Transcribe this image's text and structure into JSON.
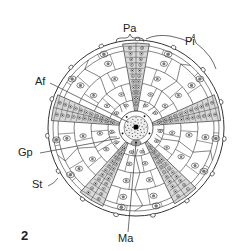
{
  "figure": {
    "number": "2",
    "colors": {
      "line": "#333333",
      "ambulacral_fill": "#d8d8d8",
      "background": "#ffffff"
    }
  },
  "labels": {
    "pa": "Pa",
    "pi": "Pi",
    "af": "Af",
    "gp": "Gp",
    "st": "St",
    "ma": "Ma"
  },
  "geometry": {
    "center": [
      136,
      128
    ],
    "radius": 88,
    "ambulacra_angles_deg": [
      -90,
      -14,
      54,
      122,
      -166
    ],
    "ambulacra_half_width_deg": 9,
    "apical_disc_radius": 17,
    "rings": [
      28,
      45,
      62,
      78
    ]
  }
}
